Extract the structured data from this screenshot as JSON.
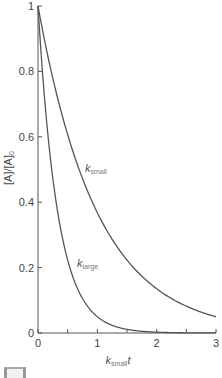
{
  "chart_data": {
    "type": "line",
    "title": "",
    "xlabel": "k_small t",
    "xlabel_main": "k",
    "xlabel_sub": "small",
    "xlabel_tail": "t",
    "ylabel": "[A]/[A]0",
    "ylabel_main": "[A]/[A]",
    "ylabel_sub": "0",
    "xlim": [
      0,
      3
    ],
    "ylim": [
      0,
      1
    ],
    "grid": false,
    "legend": "none (inline curve labels)",
    "x_ticks": [
      "0",
      "1",
      "2",
      "3"
    ],
    "x_minor_ticks": [
      0.5,
      1.5,
      2.5
    ],
    "y_ticks": [
      "0",
      "0.2",
      "0.4",
      "0.6",
      "0.8",
      "1"
    ],
    "x": [
      0,
      0.25,
      0.5,
      0.75,
      1.0,
      1.25,
      1.5,
      1.75,
      2.0,
      2.25,
      2.5,
      2.75,
      3.0
    ],
    "series": [
      {
        "name": "k_small",
        "label_main": "k",
        "label_sub": "small",
        "rate_relative": 1,
        "values": [
          1.0,
          0.78,
          0.61,
          0.47,
          0.37,
          0.29,
          0.22,
          0.17,
          0.14,
          0.11,
          0.08,
          0.06,
          0.05
        ]
      },
      {
        "name": "k_large",
        "label_main": "k",
        "label_sub": "large",
        "rate_relative": 3,
        "values": [
          1.0,
          0.47,
          0.22,
          0.11,
          0.05,
          0.02,
          0.01,
          0.01,
          0.0,
          0.0,
          0.0,
          0.0,
          0.0
        ]
      }
    ]
  }
}
